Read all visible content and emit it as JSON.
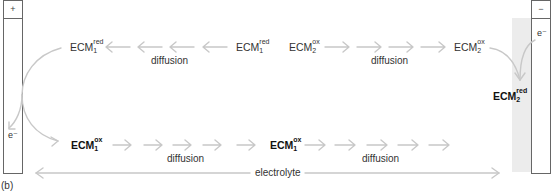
{
  "figure_label": "(b)",
  "electrodes": {
    "left": {
      "sign": "+",
      "electron_label": "e⁻"
    },
    "right": {
      "sign": "−",
      "electron_label": "e⁻"
    }
  },
  "top_row": {
    "species": [
      {
        "base": "ECM",
        "sub": "1",
        "sup": "red"
      },
      {
        "base": "ECM",
        "sub": "1",
        "sup": "red"
      },
      {
        "base": "ECM",
        "sub": "2",
        "sup": "ox"
      },
      {
        "base": "ECM",
        "sub": "2",
        "sup": "ox"
      }
    ],
    "diffusion_labels": [
      "diffusion",
      "diffusion"
    ]
  },
  "right_product": {
    "base": "ECM",
    "sub": "2",
    "sup": "red"
  },
  "bottom_row": {
    "species": [
      {
        "base": "ECM",
        "sub": "1",
        "sup": "ox"
      },
      {
        "base": "ECM",
        "sub": "1",
        "sup": "ox"
      }
    ],
    "diffusion_labels": [
      "diffusion",
      "diffusion"
    ]
  },
  "electrolyte_label": "electrolyte",
  "colors": {
    "arrow": "#c8c8c8",
    "electrode_border": "#555555",
    "shaded_zone": "#ececec",
    "text": "#333333"
  }
}
